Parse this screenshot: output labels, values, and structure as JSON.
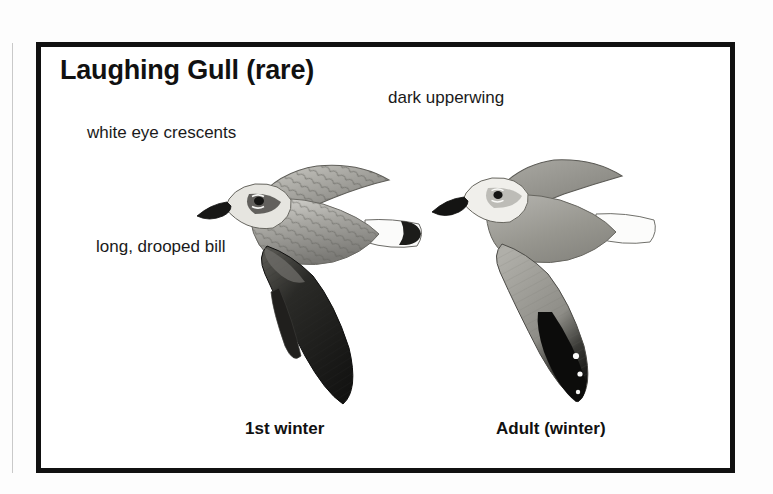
{
  "plate": {
    "title": "Laughing Gull (rare)",
    "frame_color": "#111111",
    "background_color": "#ffffff"
  },
  "callouts": [
    {
      "id": "white-eye-crescents",
      "text": "white eye crescents"
    },
    {
      "id": "dark-upperwing",
      "text": "dark upperwing"
    },
    {
      "id": "long-drooped-bill",
      "text": "long, drooped bill"
    }
  ],
  "figures": [
    {
      "id": "first-winter",
      "caption": "1st winter",
      "description": "Laughing Gull in flight, head to left, brownish-gray scalloped upperwing, blackish outer wing, white tail with dark terminal band",
      "colors": {
        "wing_dark": "#1b1b1b",
        "wing_mid": "#8d8d8a",
        "wing_light": "#c3c2bd",
        "head": "#e2e1dd",
        "bill": "#1a1a1a",
        "tail_band": "#1c1c1c"
      }
    },
    {
      "id": "adult-winter",
      "caption": "Adult (winter)",
      "description": "Laughing Gull in flight, head to left, uniform medium-gray upperwing with solid black wingtip and small white spots, all-white tail",
      "colors": {
        "wing_dark": "#111111",
        "wing_mid": "#9b9b98",
        "wing_light": "#cfcecb",
        "head": "#efeeea",
        "bill": "#141414",
        "tail_band": "#ffffff"
      }
    }
  ],
  "captions": {
    "left": "1st winter",
    "right": "Adult (winter)"
  }
}
